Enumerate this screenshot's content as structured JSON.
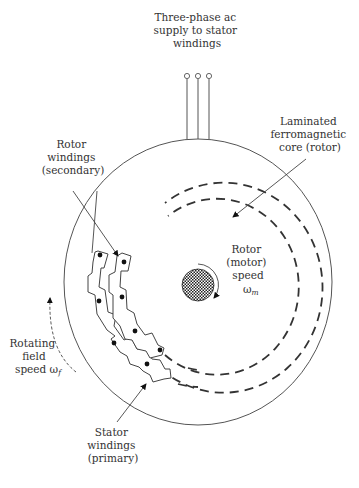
{
  "diagram": {
    "labels": {
      "supply": [
        "Three-phase ac",
        "supply to stator",
        "windings"
      ],
      "core": [
        "Laminated",
        "ferromagnetic",
        "core (rotor)"
      ],
      "rotor_windings": [
        "Rotor",
        "windings",
        "(secondary)"
      ],
      "rotor_speed": [
        "Rotor",
        "(motor)",
        "speed"
      ],
      "rotor_speed_symbol": "ω",
      "rotor_speed_subscript": "m",
      "field": [
        "Rotating",
        "field"
      ],
      "field_speed_prefix": "speed ω",
      "field_speed_subscript": "f",
      "stator_windings": [
        "Stator",
        "windings",
        "(primary)"
      ]
    },
    "components": {
      "supply_terminals": 3,
      "conductor_count": 8
    },
    "colors": {
      "line": "#555555",
      "dashed": "#333333",
      "rotor_fill": "#222222",
      "text": "#333333"
    }
  }
}
